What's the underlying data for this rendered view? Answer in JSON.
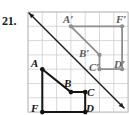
{
  "problem": {
    "number": "21."
  },
  "figure": {
    "type": "coordinate-grid-reflection",
    "grid": {
      "columns": 7,
      "rows": 7,
      "cell_size_px": 14.3,
      "origin_px": [
        28,
        12
      ],
      "line_color": "#c9c9c9",
      "border_color": "#b4b4b4"
    },
    "line_of_reflection": {
      "name": "line-of-reflection",
      "from_px": [
        29,
        13
      ],
      "to_px": [
        124,
        108
      ],
      "color": "#1f1f1f",
      "arrow_both_ends": true
    },
    "preimage": {
      "name": "preimage-polygon-ABCDF",
      "color": "#141414",
      "vertices": [
        {
          "label": "A",
          "grid": [
            1,
            4
          ],
          "px": [
            42.3,
            69.2
          ],
          "label_px": [
            31,
            67
          ],
          "label_anchor": "start"
        },
        {
          "label": "B",
          "grid": [
            3,
            5.6
          ],
          "px": [
            70.9,
            92.1
          ],
          "label_px": [
            64,
            87
          ],
          "label_anchor": "start"
        },
        {
          "label": "C",
          "grid": [
            4,
            5.6
          ],
          "px": [
            85.2,
            92.1
          ],
          "label_px": [
            87,
            96
          ],
          "label_anchor": "start"
        },
        {
          "label": "D",
          "grid": [
            4,
            7
          ],
          "px": [
            85.2,
            112.1
          ],
          "label_px": [
            86,
            112
          ],
          "label_anchor": "start"
        },
        {
          "label": "F",
          "grid": [
            1,
            7
          ],
          "px": [
            42.3,
            112.1
          ],
          "label_px": [
            31,
            112
          ],
          "label_anchor": "start"
        }
      ]
    },
    "image": {
      "name": "image-polygon-A1B1C1D1F1",
      "color": "#8f8f8f",
      "vertices": [
        {
          "label": "A′",
          "grid": [
            3,
            1
          ],
          "px": [
            70.9,
            26.3
          ],
          "label_px": [
            63,
            23
          ],
          "label_anchor": "start"
        },
        {
          "label": "F′",
          "grid": [
            7,
            1
          ],
          "px": [
            122.1,
            26.3
          ],
          "label_px": [
            116,
            23
          ],
          "label_anchor": "start"
        },
        {
          "label": "D′",
          "grid": [
            7,
            4
          ],
          "px": [
            122.1,
            69.2
          ],
          "label_px": [
            114,
            68
          ],
          "label_anchor": "start"
        },
        {
          "label": "C′",
          "grid": [
            5.6,
            4
          ],
          "px": [
            99.5,
            69.2
          ],
          "label_px": [
            89,
            71
          ],
          "label_anchor": "start"
        },
        {
          "label": "B′",
          "grid": [
            5.6,
            3
          ],
          "px": [
            99.5,
            54.9
          ],
          "label_px": [
            79,
            57
          ],
          "label_anchor": "start"
        }
      ]
    }
  }
}
